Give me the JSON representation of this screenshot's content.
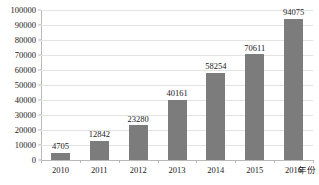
{
  "chart_data": {
    "type": "bar",
    "title": "",
    "subtitle": "",
    "xlabel": "年份",
    "ylabel": "",
    "categories": [
      "2010",
      "2011",
      "2012",
      "2013",
      "2014",
      "2015",
      "2016"
    ],
    "values": [
      4705,
      12842,
      23280,
      40161,
      58254,
      70611,
      94075
    ],
    "data_labels": [
      "4705",
      "12842",
      "23280",
      "40161",
      "58254",
      "70611",
      "94075"
    ],
    "series": [
      {
        "name": "",
        "values": [
          4705,
          12842,
          23280,
          40161,
          58254,
          70611,
          94075
        ]
      }
    ],
    "ylim": [
      0,
      100000
    ],
    "ytick_step": 10000,
    "ytick_labels": [
      "0",
      "10000",
      "20000",
      "30000",
      "40000",
      "50000",
      "60000",
      "70000",
      "80000",
      "90000",
      "100000"
    ],
    "ytick_values": [
      0,
      10000,
      20000,
      30000,
      40000,
      50000,
      60000,
      70000,
      80000,
      90000,
      100000
    ],
    "grid": true,
    "grid_axis": "y",
    "legend": false,
    "legend_position": "none",
    "bar_color": "#7c7c7c",
    "gridline_color": "#e3e3e3",
    "axis_color": "#b9b9b9",
    "background_color": "#ffffff",
    "text_color": "#1a1a1a"
  }
}
